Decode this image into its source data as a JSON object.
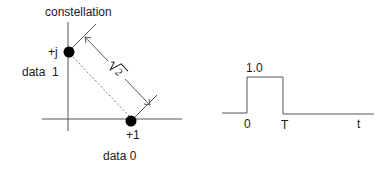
{
  "constellation": {
    "title": "constellation",
    "points": [
      {
        "label": "+j",
        "data_label": "data  1",
        "x": 0,
        "y": 1
      },
      {
        "label": "+1",
        "data_label": "data 0",
        "x": 1,
        "y": 0
      }
    ],
    "distance_label": "√2"
  },
  "pulse": {
    "amplitude_label": "1.0",
    "start_label": "0",
    "end_label": "T",
    "axis_label": "t"
  },
  "colors": {
    "line": "#555555",
    "dot": "#000000",
    "text": "#1a1a1a"
  }
}
